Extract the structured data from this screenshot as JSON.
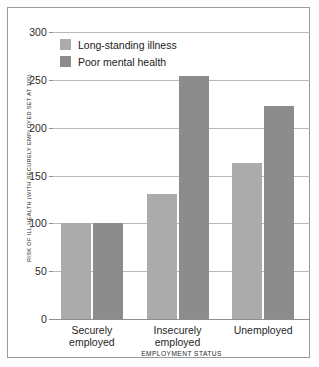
{
  "chart_data": {
    "type": "bar",
    "title": "",
    "xlabel": "EMPLOYMENT STATUS",
    "ylabel": "RISK OF ILL HEALTH (WITH SECURELY EMPLOYED SET AT 100)",
    "categories": [
      "Securely\nemployed",
      "Insecurely\nemployed",
      "Unemployed"
    ],
    "series": [
      {
        "name": "Long-standing illness",
        "color": "#ababab",
        "values": [
          100,
          131,
          163
        ]
      },
      {
        "name": "Poor mental health",
        "color": "#8c8c8c",
        "values": [
          100,
          254,
          223
        ]
      }
    ],
    "ylim": [
      0,
      300
    ],
    "yticks": [
      0,
      50,
      100,
      150,
      200,
      250,
      300
    ],
    "ytick_labels": [
      "0",
      "50",
      "100",
      "150",
      "200",
      "250",
      "300"
    ],
    "grid": true,
    "legend_position": "top-left"
  },
  "colors": {
    "light_bar": "#ababab",
    "dark_bar": "#8c8c8c",
    "gridline": "#b9b9b9",
    "axis": "#8f8f8f",
    "frame_border": "#9a9a9a",
    "background": "#ffffff"
  }
}
